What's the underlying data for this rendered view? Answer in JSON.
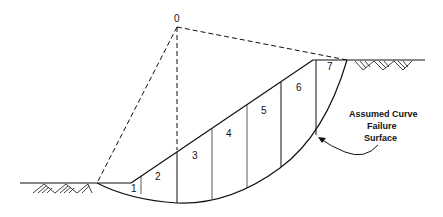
{
  "diagram": {
    "type": "slope-stability-method-of-slices",
    "center_label": "0",
    "slice_labels": [
      "1",
      "2",
      "3",
      "4",
      "5",
      "6",
      "7"
    ],
    "annotation": {
      "line1": "Assumed Curve",
      "line2": "Failure",
      "line3": "Surface"
    },
    "colors": {
      "line": "#111111",
      "background": "#ffffff"
    }
  }
}
